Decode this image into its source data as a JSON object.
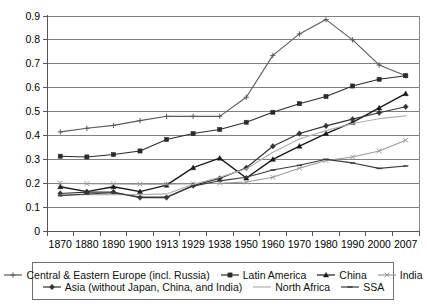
{
  "chart_data": {
    "type": "line",
    "title": "",
    "xlabel": "",
    "ylabel": "",
    "grid": true,
    "legend_position": "bottom",
    "ylim": [
      0,
      0.9
    ],
    "yticks": [
      "0",
      "0.1",
      "0.2",
      "0.3",
      "0.4",
      "0.5",
      "0.6",
      "0.7",
      "0.8",
      "0.9"
    ],
    "ytick_values": [
      0,
      0.1,
      0.2,
      0.3,
      0.4,
      0.5,
      0.6,
      0.7,
      0.8,
      0.9
    ],
    "categories": [
      "1870",
      "1880",
      "1890",
      "1900",
      "1913",
      "1929",
      "1938",
      "1950",
      "1960",
      "1970",
      "1980",
      "1990",
      "2000",
      "2007"
    ],
    "series": [
      {
        "name": "Central & Eastern Europe (incl. Russia)",
        "marker": "plus",
        "color": "#5a5a5a",
        "width": 1.1,
        "values": [
          0.415,
          0.43,
          0.442,
          0.462,
          0.48,
          0.48,
          0.48,
          0.56,
          0.735,
          0.825,
          0.885,
          0.8,
          0.695,
          0.65
        ]
      },
      {
        "name": "Latin America",
        "marker": "square",
        "color": "#2b2b2b",
        "width": 1.1,
        "values": [
          0.313,
          0.31,
          0.32,
          0.335,
          0.383,
          0.408,
          0.425,
          0.455,
          0.497,
          0.533,
          0.563,
          0.607,
          0.635,
          0.65
        ]
      },
      {
        "name": "China",
        "marker": "triangle",
        "color": "#1a1a1a",
        "width": 1.4,
        "values": [
          0.185,
          0.165,
          0.185,
          0.165,
          0.192,
          0.265,
          0.305,
          0.222,
          0.3,
          0.355,
          0.408,
          0.455,
          0.515,
          0.575
        ]
      },
      {
        "name": "India",
        "marker": "cross",
        "color": "#9a9a9a",
        "width": 1.1,
        "values": [
          0.2,
          0.198,
          0.197,
          0.196,
          0.196,
          0.198,
          0.2,
          0.205,
          0.225,
          0.263,
          0.295,
          0.31,
          0.335,
          0.38
        ]
      },
      {
        "name": "Asia (without Japan, China, and India)",
        "marker": "diamond",
        "color": "#333333",
        "width": 1.2,
        "values": [
          0.157,
          0.163,
          0.163,
          0.14,
          0.14,
          0.19,
          0.22,
          0.265,
          0.355,
          0.408,
          0.44,
          0.468,
          0.495,
          0.52
        ]
      },
      {
        "name": "North Africa",
        "marker": "none",
        "color": "#b0b0b0",
        "width": 1.2,
        "values": [
          0.15,
          0.152,
          0.152,
          0.152,
          0.155,
          0.195,
          0.225,
          0.26,
          0.33,
          0.385,
          0.42,
          0.45,
          0.47,
          0.482
        ]
      },
      {
        "name": "SSA",
        "marker": "dash",
        "color": "#3a3a3a",
        "width": 1.1,
        "values": [
          0.148,
          0.155,
          0.16,
          0.142,
          0.142,
          0.188,
          0.21,
          0.225,
          0.255,
          0.275,
          0.3,
          0.285,
          0.262,
          0.272
        ]
      }
    ]
  },
  "legend": {
    "rows": [
      [
        {
          "label": "Central & Eastern Europe (incl. Russia)",
          "marker": "plus",
          "color": "#5a5a5a"
        },
        {
          "label": "Latin America",
          "marker": "square",
          "color": "#2b2b2b"
        },
        {
          "label": "China",
          "marker": "triangle",
          "color": "#1a1a1a"
        },
        {
          "label": "India",
          "marker": "cross",
          "color": "#9a9a9a"
        }
      ],
      [
        {
          "label": "Asia (without Japan, China, and India)",
          "marker": "diamond",
          "color": "#333333"
        },
        {
          "label": "North Africa",
          "marker": "none",
          "color": "#b0b0b0"
        },
        {
          "label": "SSA",
          "marker": "dash",
          "color": "#3a3a3a"
        }
      ]
    ]
  }
}
